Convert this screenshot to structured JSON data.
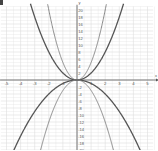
{
  "chart_data": {
    "type": "line",
    "title": "",
    "xlabel": "x",
    "ylabel": "y",
    "xlim": [
      -5.5,
      5.5
    ],
    "ylim": [
      -20,
      21
    ],
    "grid": true,
    "x_ticks": [
      -5,
      -4,
      -3,
      -2,
      -1,
      1,
      2,
      3,
      4,
      5
    ],
    "y_ticks": [
      -20,
      -18,
      -16,
      -14,
      -12,
      -10,
      -8,
      -6,
      -4,
      -2,
      2,
      4,
      6,
      8,
      10,
      12,
      14,
      16,
      18,
      20
    ],
    "series": [
      {
        "name": "y = 2x^2",
        "coef": 2,
        "color": "#555555",
        "width": 1.3
      },
      {
        "name": "y = 5x^2",
        "coef": 5,
        "color": "#888888",
        "width": 1.0
      },
      {
        "name": "y = -x^2",
        "coef": -1,
        "color": "#555555",
        "width": 1.3
      },
      {
        "name": "y = -3x^2",
        "coef": -3,
        "color": "#888888",
        "width": 1.0
      }
    ]
  },
  "colors": {
    "grid": "#dddddd",
    "axis": "#555555",
    "label": "#555555"
  }
}
